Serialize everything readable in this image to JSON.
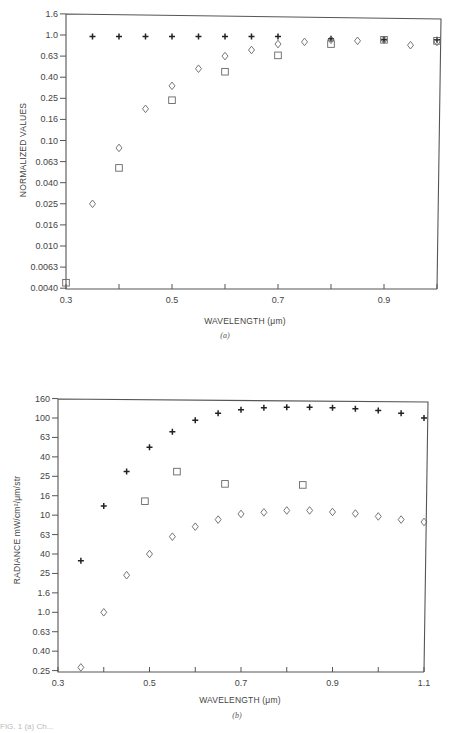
{
  "chart_data": [
    {
      "id": "a",
      "type": "scatter",
      "panel_label": "(a)",
      "title": "",
      "xlabel": "WAVELENGTH (μm)",
      "ylabel": "NORMALIZED VALUES",
      "yscale": "log",
      "xlim": [
        0.3,
        1.0
      ],
      "x_ticks": [
        0.3,
        0.4,
        0.5,
        0.6,
        0.7,
        0.8,
        0.9,
        1.0
      ],
      "x_tick_labels": [
        "0.3",
        "",
        "0.5",
        "",
        "0.7",
        "",
        "0.9",
        ""
      ],
      "y_tick_labels": [
        "1.6",
        "1.0",
        "0.63",
        "0.40",
        "0.25",
        "0.16",
        "0.10",
        "0.063",
        "0.040",
        "0.025",
        "0.016",
        "0.010",
        "0.0063",
        "0.0040"
      ],
      "y_tick_values": [
        1.6,
        1.0,
        0.63,
        0.4,
        0.25,
        0.16,
        0.1,
        0.063,
        0.04,
        0.025,
        0.016,
        0.01,
        0.0063,
        0.004
      ],
      "grid": false,
      "legend": null,
      "series": [
        {
          "name": "plus",
          "marker": "plus",
          "x": [
            0.35,
            0.4,
            0.45,
            0.5,
            0.55,
            0.6,
            0.65,
            0.7,
            0.8,
            0.9,
            1.0
          ],
          "y": [
            0.97,
            0.97,
            0.97,
            0.97,
            0.97,
            0.97,
            0.97,
            0.97,
            0.92,
            0.9,
            0.9
          ]
        },
        {
          "name": "diamond",
          "marker": "diamond",
          "x": [
            0.35,
            0.4,
            0.45,
            0.5,
            0.55,
            0.6,
            0.65,
            0.7,
            0.75,
            0.8,
            0.85,
            0.9,
            0.95,
            1.0
          ],
          "y": [
            0.025,
            0.085,
            0.2,
            0.33,
            0.48,
            0.63,
            0.72,
            0.82,
            0.86,
            0.9,
            0.88,
            0.9,
            0.8,
            0.86
          ]
        },
        {
          "name": "square",
          "marker": "square",
          "x": [
            0.3,
            0.4,
            0.5,
            0.6,
            0.7,
            0.8,
            0.9,
            1.0
          ],
          "y": [
            0.0045,
            0.055,
            0.24,
            0.45,
            0.64,
            0.82,
            0.9,
            0.88
          ]
        }
      ]
    },
    {
      "id": "b",
      "type": "scatter",
      "panel_label": "(b)",
      "title": "",
      "xlabel": "WAVELENGTH (μm)",
      "ylabel": "RADIANCE mW/cm²/μm/str",
      "yscale": "log",
      "xlim": [
        0.3,
        1.1
      ],
      "x_ticks": [
        0.3,
        0.4,
        0.5,
        0.6,
        0.7,
        0.8,
        0.9,
        1.0,
        1.1
      ],
      "x_tick_labels": [
        "0.3",
        "",
        "0.5",
        "",
        "0.7",
        "",
        "0.9",
        "",
        "1.1"
      ],
      "y_tick_labels": [
        "160",
        "100",
        "63",
        "40",
        "25",
        "16",
        "10",
        "63",
        "40",
        "25",
        "1.6",
        "1.0",
        "0.63",
        "0.40",
        "0.25"
      ],
      "y_tick_values": [
        160,
        100,
        63,
        40,
        25,
        16,
        10,
        6.3,
        4.0,
        2.5,
        1.6,
        1.0,
        0.63,
        0.4,
        0.25
      ],
      "grid": false,
      "legend": null,
      "series": [
        {
          "name": "plus",
          "marker": "plus",
          "x": [
            0.35,
            0.4,
            0.45,
            0.5,
            0.55,
            0.6,
            0.65,
            0.7,
            0.75,
            0.8,
            0.85,
            0.9,
            0.95,
            1.0,
            1.05,
            1.1
          ],
          "y": [
            3.4,
            12.5,
            28,
            50,
            72,
            95,
            112,
            122,
            128,
            130,
            130,
            128,
            125,
            120,
            112,
            100
          ]
        },
        {
          "name": "square",
          "marker": "square",
          "x": [
            0.49,
            0.56,
            0.665,
            0.835
          ],
          "y": [
            14,
            28,
            21,
            20.5
          ]
        },
        {
          "name": "diamond",
          "marker": "diamond",
          "x": [
            0.35,
            0.4,
            0.45,
            0.5,
            0.55,
            0.6,
            0.65,
            0.7,
            0.75,
            0.8,
            0.85,
            0.9,
            0.95,
            1.0,
            1.05,
            1.1
          ],
          "y": [
            0.27,
            1.0,
            2.4,
            4.0,
            6.0,
            7.6,
            9.0,
            10.3,
            10.7,
            11.2,
            11.2,
            10.8,
            10.4,
            9.7,
            9.0,
            8.5
          ]
        }
      ]
    }
  ],
  "caption_partial": "FIG. 1 (a) Ch..."
}
